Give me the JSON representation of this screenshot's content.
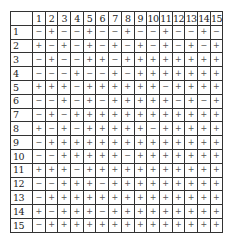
{
  "table": {
    "corner": "",
    "columns": [
      "1",
      "2",
      "3",
      "4",
      "5",
      "6",
      "7",
      "8",
      "9",
      "10",
      "11",
      "12",
      "13",
      "14",
      "15"
    ],
    "rows": [
      {
        "label": "1",
        "cells": [
          "−",
          "+",
          "−",
          "−",
          "+",
          "−",
          "−",
          "+",
          "−",
          "−",
          "+",
          "−",
          "−",
          "+",
          "−"
        ]
      },
      {
        "label": "2",
        "cells": [
          "+",
          "−",
          "+",
          "−",
          "+",
          "−",
          "+",
          "−",
          "+",
          "−",
          "+",
          "−",
          "+",
          "−",
          "+"
        ]
      },
      {
        "label": "3",
        "cells": [
          "−",
          "+",
          "−",
          "−",
          "+",
          "+",
          "−",
          "+",
          "+",
          "+",
          "+",
          "+",
          "+",
          "+",
          "+"
        ]
      },
      {
        "label": "4",
        "cells": [
          "−",
          "−",
          "−",
          "+",
          "−",
          "−",
          "+",
          "−",
          "+",
          "+",
          "+",
          "+",
          "+",
          "+",
          "+"
        ]
      },
      {
        "label": "5",
        "cells": [
          "+",
          "+",
          "+",
          "−",
          "+",
          "+",
          "+",
          "+",
          "+",
          "+",
          "−",
          "+",
          "+",
          "+",
          "+"
        ]
      },
      {
        "label": "6",
        "cells": [
          "−",
          "−",
          "+",
          "−",
          "+",
          "−",
          "+",
          "+",
          "+",
          "+",
          "+",
          "−",
          "+",
          "−",
          "+"
        ]
      },
      {
        "label": "7",
        "cells": [
          "−",
          "+",
          "−",
          "+",
          "+",
          "+",
          "+",
          "+",
          "+",
          "+",
          "+",
          "+",
          "+",
          "+",
          "+"
        ]
      },
      {
        "label": "8",
        "cells": [
          "+",
          "−",
          "+",
          "−",
          "+",
          "+",
          "+",
          "+",
          "+",
          "−",
          "+",
          "+",
          "+",
          "+",
          "+"
        ]
      },
      {
        "label": "9",
        "cells": [
          "−",
          "+",
          "+",
          "+",
          "+",
          "+",
          "+",
          "+",
          "+",
          "+",
          "+",
          "+",
          "+",
          "+",
          "+"
        ]
      },
      {
        "label": "10",
        "cells": [
          "−",
          "−",
          "+",
          "+",
          "+",
          "+",
          "+",
          "−",
          "+",
          "+",
          "+",
          "+",
          "+",
          "+",
          "+"
        ]
      },
      {
        "label": "11",
        "cells": [
          "+",
          "+",
          "+",
          "−",
          "+",
          "+",
          "+",
          "+",
          "+",
          "+",
          "+",
          "+",
          "+",
          "+",
          "+"
        ]
      },
      {
        "label": "12",
        "cells": [
          "−",
          "−",
          "+",
          "+",
          "+",
          "−",
          "+",
          "+",
          "+",
          "+",
          "+",
          "+",
          "+",
          "+",
          "+"
        ]
      },
      {
        "label": "13",
        "cells": [
          "−",
          "+",
          "+",
          "+",
          "+",
          "+",
          "+",
          "+",
          "+",
          "+",
          "+",
          "+",
          "+",
          "+",
          "+"
        ]
      },
      {
        "label": "14",
        "cells": [
          "+",
          "−",
          "+",
          "+",
          "+",
          "−",
          "+",
          "+",
          "+",
          "+",
          "+",
          "+",
          "+",
          "+",
          "+"
        ]
      },
      {
        "label": "15",
        "cells": [
          "−",
          "+",
          "+",
          "+",
          "+",
          "+",
          "+",
          "+",
          "+",
          "+",
          "+",
          "+",
          "+",
          "+",
          "+"
        ]
      }
    ]
  }
}
